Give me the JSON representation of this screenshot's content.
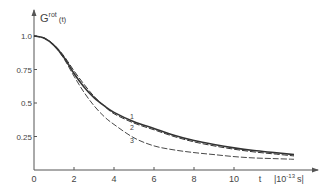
{
  "chart_data": {
    "type": "line",
    "title": "",
    "ylabel": "G",
    "ylabel_sup": "rot",
    "ylabel_arg": "(t)",
    "xlabel": "t",
    "xunit_base": "10",
    "xunit_exp": "-13",
    "xunit_suffix": "s",
    "xlim": [
      0,
      13
    ],
    "ylim": [
      0,
      1.0
    ],
    "x_ticks": [
      "0",
      "2",
      "4",
      "6",
      "8",
      "10"
    ],
    "y_ticks": [
      "0.25",
      "0.5",
      "0.75",
      "1.0"
    ],
    "grid": false,
    "legend": "inline labels 1, 2, 3 near t≈5",
    "x": [
      0,
      0.5,
      1,
      1.5,
      2,
      2.5,
      3,
      3.5,
      4,
      5,
      6,
      7,
      8,
      9,
      10,
      11,
      12,
      13
    ],
    "series": [
      {
        "name": "1",
        "style": "solid",
        "values": [
          1.0,
          0.985,
          0.93,
          0.84,
          0.72,
          0.62,
          0.54,
          0.48,
          0.43,
          0.36,
          0.31,
          0.26,
          0.22,
          0.19,
          0.165,
          0.145,
          0.13,
          0.115
        ]
      },
      {
        "name": "2",
        "style": "dashed",
        "values": [
          1.0,
          0.985,
          0.935,
          0.85,
          0.74,
          0.64,
          0.55,
          0.48,
          0.42,
          0.35,
          0.3,
          0.25,
          0.21,
          0.18,
          0.155,
          0.135,
          0.12,
          0.105
        ]
      },
      {
        "name": "3",
        "style": "dashed",
        "values": [
          1.0,
          0.985,
          0.93,
          0.83,
          0.7,
          0.58,
          0.48,
          0.4,
          0.34,
          0.24,
          0.18,
          0.15,
          0.13,
          0.115,
          0.1,
          0.09,
          0.085,
          0.08
        ]
      }
    ],
    "curve_labels": [
      {
        "text": "1",
        "t": 4.9,
        "g": 0.38
      },
      {
        "text": "2",
        "t": 4.9,
        "g": 0.3
      },
      {
        "text": "3",
        "t": 4.9,
        "g": 0.2
      }
    ]
  }
}
